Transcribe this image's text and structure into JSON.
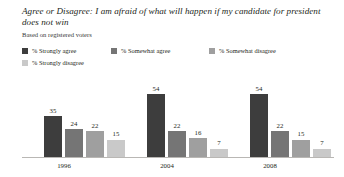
{
  "chart_data": {
    "type": "bar",
    "title": "Agree or Disagree: I am afraid of what will happen if my candidate for president does not win",
    "subtitle": "Based on registered voters",
    "categories": [
      "1996",
      "2004",
      "2008"
    ],
    "series": [
      {
        "name": "% Strongly agree",
        "color": "#3d3d3d",
        "values": [
          35,
          54,
          54
        ]
      },
      {
        "name": "% Somewhat agree",
        "color": "#757575",
        "values": [
          24,
          22,
          22
        ]
      },
      {
        "name": "% Somewhat disagree",
        "color": "#9f9f9f",
        "values": [
          22,
          16,
          15
        ]
      },
      {
        "name": "% Strongly disagree",
        "color": "#c9c9c9",
        "values": [
          15,
          7,
          7
        ]
      }
    ],
    "xlabel": "",
    "ylabel": "",
    "ylim": [
      0,
      60
    ],
    "grid": false,
    "legend_position": "top",
    "value_labels": true
  },
  "legend": {
    "items": [
      {
        "label": "% Strongly agree",
        "color": "#3d3d3d"
      },
      {
        "label": "% Somewhat agree",
        "color": "#757575"
      },
      {
        "label": "% Somewhat disagree",
        "color": "#9f9f9f"
      },
      {
        "label": "% Strongly disagree",
        "color": "#c9c9c9"
      }
    ]
  },
  "bars": {
    "g0": [
      {
        "value": "35",
        "color": "#3d3d3d"
      },
      {
        "value": "24",
        "color": "#757575"
      },
      {
        "value": "22",
        "color": "#9f9f9f"
      },
      {
        "value": "15",
        "color": "#c9c9c9"
      }
    ],
    "g1": [
      {
        "value": "54",
        "color": "#3d3d3d"
      },
      {
        "value": "22",
        "color": "#757575"
      },
      {
        "value": "16",
        "color": "#9f9f9f"
      },
      {
        "value": "7",
        "color": "#c9c9c9"
      }
    ],
    "g2": [
      {
        "value": "54",
        "color": "#3d3d3d"
      },
      {
        "value": "22",
        "color": "#757575"
      },
      {
        "value": "15",
        "color": "#9f9f9f"
      },
      {
        "value": "7",
        "color": "#c9c9c9"
      }
    ]
  },
  "axis": {
    "categories": [
      "1996",
      "2004",
      "2008"
    ]
  }
}
